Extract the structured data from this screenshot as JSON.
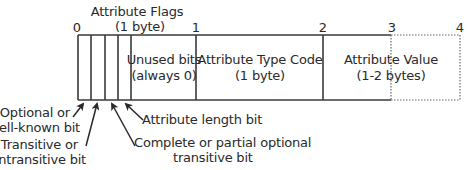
{
  "header": {
    "title": "Attribute Flags",
    "subtitle": "(1 byte)"
  },
  "byte_markers": [
    "0",
    "1",
    "2",
    "3",
    "4"
  ],
  "fields": [
    {
      "name": "unused-bits",
      "line1": "Unused bits",
      "line2": "(always 0)"
    },
    {
      "name": "attribute-type-code",
      "line1": "Attribute Type Code",
      "line2": "(1 byte)"
    },
    {
      "name": "attribute-value",
      "line1": "Attribute Value",
      "line2": "(1-2 bytes)"
    }
  ],
  "bit_labels": {
    "optional": {
      "line1": "Optional or",
      "line2": "well-known bit"
    },
    "transitive": {
      "line1": "Transitive or",
      "line2": "nontransitive bit"
    },
    "partial": {
      "line1": "Complete or partial optional",
      "line2": "transitive bit"
    },
    "length": {
      "line1": "Attribute length bit"
    }
  },
  "colors": {
    "line": "#3a3a3a",
    "text": "#2a2a2a",
    "dotted": "#6a6a6a"
  }
}
